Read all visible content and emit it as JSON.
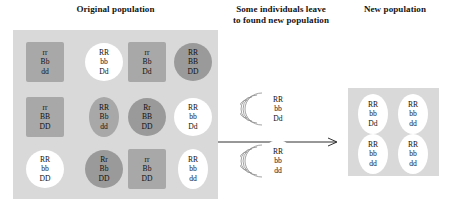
{
  "titles": {
    "original": "Original population",
    "migration_line1": "Some individuals leave",
    "migration_line2": "to found new population",
    "new": "New population"
  },
  "colors": {
    "panel_background": "#d9d9d9",
    "cell_gray": "#a8a8a8",
    "cell_dark": "#9a9a9a",
    "cell_white": "#ffffff",
    "text": "#111111",
    "page_background": "#ffffff"
  },
  "original_population": {
    "rows": [
      [
        {
          "allele_r": "rr",
          "allele_b": "Bb",
          "allele_d": "dd",
          "shape": "square",
          "fill": "gray"
        },
        {
          "allele_r": "RR",
          "allele_b": "bb",
          "allele_d": "Dd",
          "shape": "circle",
          "fill": "white"
        },
        {
          "allele_r": "rr",
          "allele_b": "Bb",
          "allele_d": "Dd",
          "shape": "square",
          "fill": "gray"
        },
        {
          "allele_r": "RR",
          "allele_b": "BB",
          "allele_d": "DD",
          "shape": "circle",
          "fill": "dark"
        }
      ],
      [
        {
          "allele_r": "rr",
          "allele_b": "BB",
          "allele_d": "DD",
          "shape": "square",
          "fill": "gray"
        },
        {
          "allele_r": "RR",
          "allele_b": "Bb",
          "allele_d": "dd",
          "shape": "ellipse",
          "fill": "gray"
        },
        {
          "allele_r": "Rr",
          "allele_b": "BB",
          "allele_d": "DD",
          "shape": "circle",
          "fill": "dark"
        },
        {
          "allele_r": "RR",
          "allele_b": "bb",
          "allele_d": "Dd",
          "shape": "circle",
          "fill": "white"
        }
      ],
      [
        {
          "allele_r": "RR",
          "allele_b": "bb",
          "allele_d": "DD",
          "shape": "circle",
          "fill": "white"
        },
        {
          "allele_r": "Rr",
          "allele_b": "Bb",
          "allele_d": "DD",
          "shape": "circle",
          "fill": "dark"
        },
        {
          "allele_r": "rr",
          "allele_b": "Bb",
          "allele_d": "DD",
          "shape": "square",
          "fill": "gray"
        },
        {
          "allele_r": "RR",
          "allele_b": "bb",
          "allele_d": "dd",
          "shape": "ellipse",
          "fill": "white"
        }
      ]
    ]
  },
  "migrants": [
    {
      "allele_r": "RR",
      "allele_b": "bb",
      "allele_d": "Dd"
    },
    {
      "allele_r": "RR",
      "allele_b": "bb",
      "allele_d": "dd"
    }
  ],
  "new_population": {
    "rows": [
      [
        {
          "allele_r": "RR",
          "allele_b": "bb",
          "allele_d": "Dd",
          "shape": "ellipse",
          "fill": "white"
        },
        {
          "allele_r": "RR",
          "allele_b": "bb",
          "allele_d": "dd",
          "shape": "ellipse",
          "fill": "white"
        }
      ],
      [
        {
          "allele_r": "RR",
          "allele_b": "bb",
          "allele_d": "dd",
          "shape": "ellipse",
          "fill": "white"
        },
        {
          "allele_r": "RR",
          "allele_b": "bb",
          "allele_d": "dd",
          "shape": "ellipse",
          "fill": "white"
        }
      ]
    ]
  },
  "icons": {
    "arrow": "right-arrow-icon",
    "motion": "motion-lines-icon"
  }
}
